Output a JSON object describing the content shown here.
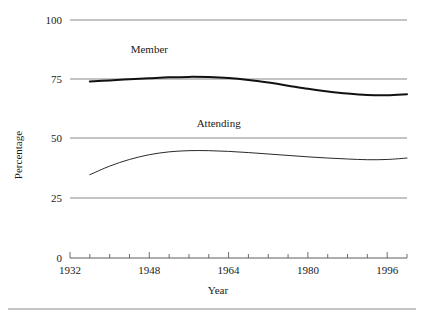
{
  "chart_data": {
    "type": "line",
    "title": "",
    "xlabel": "Year",
    "ylabel": "Percentage",
    "xlim": [
      1932,
      2000
    ],
    "ylim": [
      0,
      100
    ],
    "grid": true,
    "legend_position": "inline-labels",
    "y_ticks": [
      0,
      25,
      50,
      75,
      100
    ],
    "y_tick_labels": [
      "0",
      "25",
      "50",
      "75",
      "100"
    ],
    "x_ticks": [
      1932,
      1936,
      1940,
      1944,
      1948,
      1952,
      1956,
      1960,
      1964,
      1968,
      1972,
      1976,
      1980,
      1984,
      1988,
      1992,
      1996,
      2000
    ],
    "x_tick_labels_shown": [
      "1932",
      "1948",
      "1964",
      "1980",
      "1996"
    ],
    "x_tick_labels_shown_at": [
      1932,
      1948,
      1964,
      1980,
      1996
    ],
    "x": [
      1936,
      1940,
      1944,
      1948,
      1952,
      1956,
      1960,
      1964,
      1968,
      1972,
      1976,
      1980,
      1984,
      1988,
      1992,
      1996,
      2000
    ],
    "series": [
      {
        "name": "Member",
        "label": "Member",
        "color": "#111111",
        "line_width": 2.0,
        "values": [
          74.2,
          74.6,
          75.1,
          75.5,
          75.9,
          76.1,
          76.0,
          75.6,
          74.8,
          73.7,
          72.4,
          71.1,
          70.0,
          69.1,
          68.5,
          68.4,
          68.8
        ]
      },
      {
        "name": "Attending",
        "label": "Attending",
        "color": "#111111",
        "line_width": 0.9,
        "values": [
          35.0,
          38.6,
          41.4,
          43.4,
          44.6,
          45.1,
          45.1,
          44.8,
          44.3,
          43.7,
          43.1,
          42.5,
          42.0,
          41.6,
          41.3,
          41.4,
          42.0
        ]
      }
    ],
    "annotations": [
      {
        "text": "Member",
        "x": 1948,
        "y": 86
      },
      {
        "text": "Attending",
        "x": 1962,
        "y": 55
      }
    ]
  },
  "axis": {
    "y_title": "Percentage",
    "x_title": "Year"
  }
}
